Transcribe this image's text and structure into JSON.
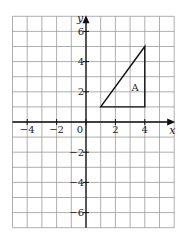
{
  "figure": {
    "type": "coordinate-grid",
    "x_axis_label": "x",
    "y_axis_label": "y",
    "x_range": [
      -5,
      6
    ],
    "y_range": [
      -7,
      7
    ],
    "x_tick_labels": [
      "−4",
      "−2",
      "0",
      "2",
      "4"
    ],
    "x_tick_values": [
      -4,
      -2,
      0,
      2,
      4
    ],
    "y_tick_labels": [
      "6",
      "4",
      "2",
      "−2",
      "−4",
      "−6"
    ],
    "y_tick_values": [
      6,
      4,
      2,
      -2,
      -4,
      -6
    ],
    "grid": true
  },
  "shape": {
    "label": "A",
    "type": "triangle",
    "vertices": [
      [
        1,
        1
      ],
      [
        4,
        1
      ],
      [
        4,
        5
      ]
    ],
    "label_position": [
      3.3,
      2.3
    ]
  },
  "colors": {
    "grid": "#9a9a9a",
    "axis": "#111111",
    "shape": "#111111"
  }
}
